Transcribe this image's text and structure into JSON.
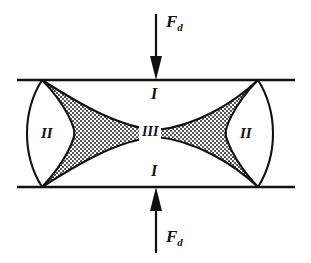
{
  "figure": {
    "background_color": "#ffffff",
    "line_color": "#111111",
    "fill_stipple_color": "#6b6b6b",
    "width": 311,
    "height": 263,
    "labels": {
      "force_top": "F",
      "force_top_sub": "d",
      "force_bottom": "F",
      "force_bottom_sub": "d",
      "region_i_top": "I",
      "region_i_bottom": "I",
      "region_ii_left": "II",
      "region_ii_right": "II",
      "region_iii": "III"
    },
    "icons": {
      "arrow_down": "arrow-down-icon",
      "arrow_up": "arrow-up-icon"
    },
    "geometry": {
      "top_plate_y": 80,
      "bottom_plate_y": 187,
      "plate_x_start": 17,
      "plate_x_end": 295,
      "arrow_x": 156,
      "arrow_top_start_y": 14,
      "arrow_top_end_y": 80,
      "arrow_bottom_start_y": 253,
      "arrow_bottom_end_y": 187,
      "left_contact_x": 42,
      "right_contact_x": 258,
      "lens_left_outer_x": 26,
      "lens_right_outer_x": 274,
      "waist_half_width": 30,
      "waist_y": 133
    }
  }
}
